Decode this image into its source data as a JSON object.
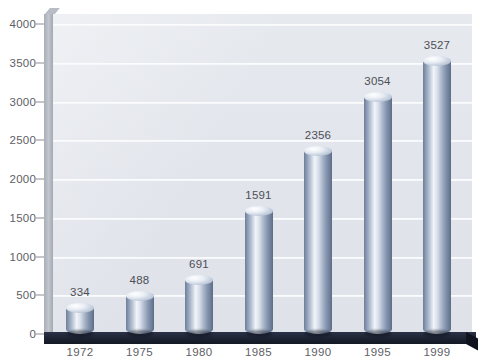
{
  "chart_data": {
    "type": "bar",
    "title": "",
    "subtitle": "",
    "xlabel": "",
    "ylabel": "",
    "categories": [
      "1972",
      "1975",
      "1980",
      "1985",
      "1990",
      "1995",
      "1999"
    ],
    "values": [
      334,
      488,
      691,
      1591,
      2356,
      3054,
      3527
    ],
    "value_labels": [
      "334",
      "488",
      "691",
      "1591",
      "2356",
      "3054",
      "3527"
    ],
    "ylim": [
      0,
      4000
    ],
    "ytick_labels": [
      "0",
      "500",
      "1000",
      "1500",
      "2000",
      "2500",
      "3000",
      "3500",
      "4000"
    ],
    "ytick_values": [
      0,
      500,
      1000,
      1500,
      2000,
      2500,
      3000,
      3500,
      4000
    ],
    "grid": true,
    "gridlines_axis": "y",
    "legend": null,
    "legend_position": "none",
    "style": "3d-cylinder",
    "colors": {
      "plot_background": "#e3e6ec",
      "gridline": "#ffffff",
      "bar_light": "#f2f5f9",
      "bar_mid": "#aab7cb",
      "bar_dark": "#5d6c86",
      "floor": "#1c2130",
      "axis_wall": "#b8bcc4",
      "tick_text": "#5e6066",
      "label_text": "#4c4f56",
      "page_background": "#ffffff"
    }
  }
}
